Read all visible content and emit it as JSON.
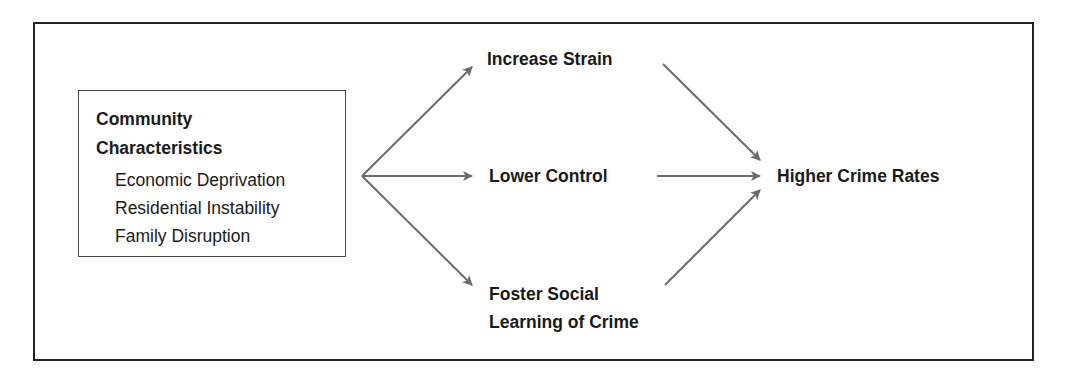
{
  "diagram": {
    "source": {
      "title_lines": [
        "Community",
        "Characteristics"
      ],
      "items": [
        "Economic Deprivation",
        "Residential Instability",
        "Family Disruption"
      ]
    },
    "mediators": [
      {
        "id": "strain",
        "lines": [
          "Increase Strain"
        ]
      },
      {
        "id": "control",
        "lines": [
          "Lower Control"
        ]
      },
      {
        "id": "learning",
        "lines": [
          "Foster Social",
          "Learning of Crime"
        ]
      }
    ],
    "outcome": {
      "label": "Higher Crime Rates"
    },
    "edges": [
      {
        "from": "source",
        "to": "strain"
      },
      {
        "from": "source",
        "to": "control"
      },
      {
        "from": "source",
        "to": "learning"
      },
      {
        "from": "strain",
        "to": "outcome"
      },
      {
        "from": "control",
        "to": "outcome"
      },
      {
        "from": "learning",
        "to": "outcome"
      }
    ],
    "colors": {
      "arrow": "#6b6b6b",
      "frame": "#222222",
      "text": "#1a1a1a"
    }
  }
}
